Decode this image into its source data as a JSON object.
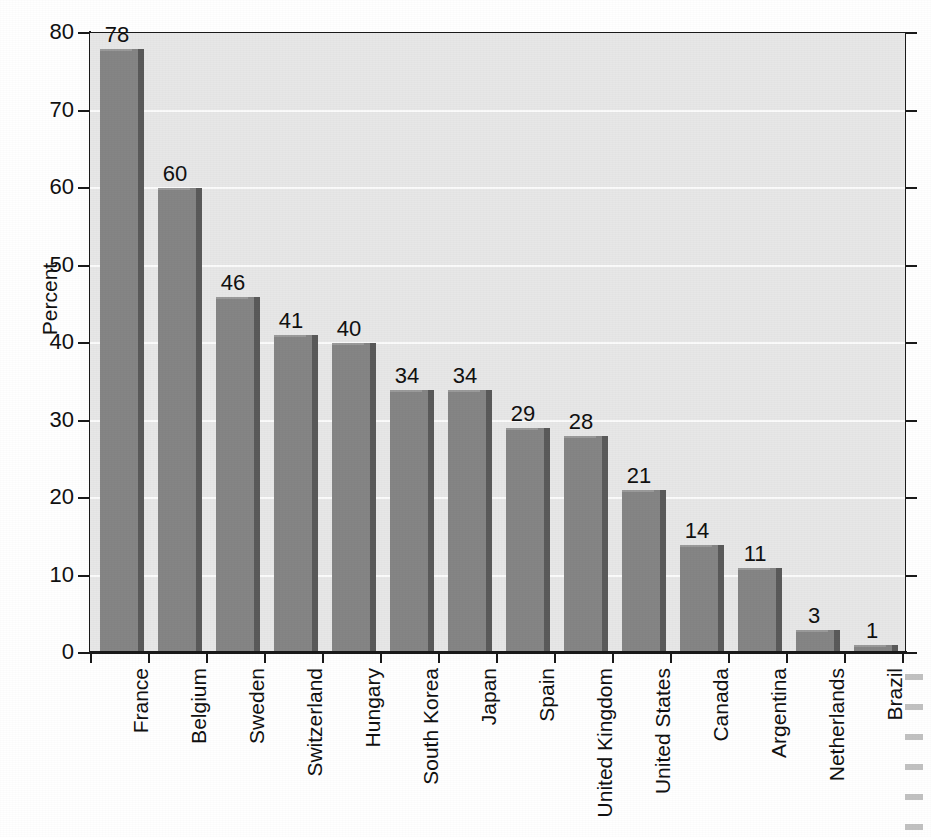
{
  "chart_data": {
    "type": "bar",
    "title": "",
    "xlabel": "",
    "ylabel": "Percent",
    "ylim": [
      0,
      80
    ],
    "ytick_values": [
      0,
      10,
      20,
      30,
      40,
      50,
      60,
      70,
      80
    ],
    "ytick_labels": [
      "0",
      "10",
      "20",
      "30",
      "40",
      "50",
      "60",
      "70",
      "80"
    ],
    "grid": "horizontal",
    "legend": "none",
    "orientation": "vertical",
    "value_labels": true,
    "category_label_rotation": 90,
    "categories": [
      "France",
      "Belgium",
      "Sweden",
      "Switzerland",
      "Hungary",
      "South Korea",
      "Japan",
      "Spain",
      "United Kingdom",
      "United States",
      "Canada",
      "Argentina",
      "Netherlands",
      "Brazil"
    ],
    "values": [
      78,
      60,
      46,
      41,
      40,
      34,
      34,
      29,
      28,
      21,
      14,
      11,
      3,
      1
    ],
    "value_label_texts": [
      "78",
      "60",
      "46",
      "41",
      "40",
      "34",
      "34",
      "29",
      "28",
      "21",
      "14",
      "11",
      "3",
      "1"
    ]
  },
  "style": {
    "bar_fill": "#858585",
    "bar_shadow": "#5a5a5a",
    "plot_background": "#e7e7e7",
    "gridline_color": "#fbfbfb",
    "axis_color": "#1a1a1a",
    "text_color": "#111111",
    "page_background": "#ffffff"
  }
}
